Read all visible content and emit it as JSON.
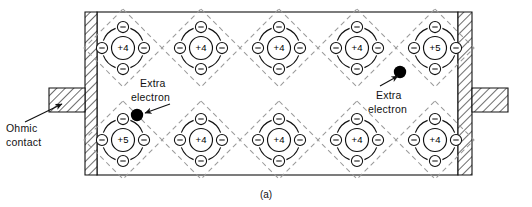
{
  "figure": {
    "caption": "(a)",
    "labels": {
      "ohmic_line1": "Ohmic",
      "ohmic_line2": "contact",
      "extra_left_line1": "Extra",
      "extra_left_line2": "electron",
      "extra_right_line1": "Extra",
      "extra_right_line2": "electron"
    },
    "colors": {
      "ink": "#111111",
      "bond_dash": "#9a9a9a",
      "electron_fill": "#ffffff",
      "extra_electron_fill": "#000000",
      "hatch": "#222222",
      "background": "#ffffff"
    },
    "electron_sign": "−",
    "rows": [
      {
        "name": "top-row",
        "cy": 48,
        "atoms": [
          {
            "core": "+4",
            "cx": 123
          },
          {
            "core": "+4",
            "cx": 201
          },
          {
            "core": "+4",
            "cx": 279
          },
          {
            "core": "+4",
            "cx": 357
          },
          {
            "core": "+5",
            "cx": 435
          }
        ]
      },
      {
        "name": "bottom-row",
        "cy": 140,
        "atoms": [
          {
            "core": "+5",
            "cx": 123
          },
          {
            "core": "+4",
            "cx": 201
          },
          {
            "core": "+4",
            "cx": 279
          },
          {
            "core": "+4",
            "cx": 357
          },
          {
            "core": "+4",
            "cx": 435
          }
        ]
      }
    ],
    "extra_electrons": [
      {
        "name": "extra-electron-bottom-left",
        "cx": 137,
        "cy": 115
      },
      {
        "name": "extra-electron-top-right",
        "cx": 400,
        "cy": 72
      }
    ]
  }
}
